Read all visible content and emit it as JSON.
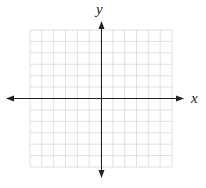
{
  "diagram": {
    "type": "coordinate-plane",
    "x_axis_label": "x",
    "y_axis_label": "y",
    "grid": {
      "columns": 12,
      "rows": 12
    },
    "colors": {
      "grid": "#d8d8d8",
      "axis": "#222222"
    }
  }
}
